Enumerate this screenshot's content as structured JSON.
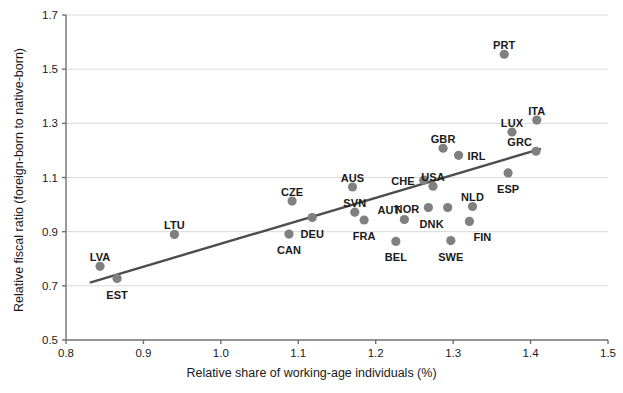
{
  "chart_data": {
    "type": "scatter",
    "title": "",
    "xlabel": "Relative share of working-age individuals (%)",
    "ylabel": "Relative fiscal ratio (foreign-born to native-born)",
    "xlim": [
      0.8,
      1.5
    ],
    "ylim": [
      0.5,
      1.7
    ],
    "xticks": [
      "0.8",
      "0.9",
      "1.0",
      "1.1",
      "1.2",
      "1.3",
      "1.4",
      "1.5"
    ],
    "xtick_values": [
      0.8,
      0.9,
      1.0,
      1.1,
      1.2,
      1.3,
      1.4,
      1.5
    ],
    "yticks": [
      "0.5",
      "0.7",
      "0.9",
      "1.1",
      "1.3",
      "1.5",
      "1.7"
    ],
    "ytick_values": [
      0.5,
      0.7,
      0.9,
      1.1,
      1.3,
      1.5,
      1.7
    ],
    "grid": "horizontal",
    "legend": "none",
    "marker_color": "#808080",
    "line_color": "#4d4d4d",
    "axis_color": "#707070",
    "grid_color": "#d9d9d9",
    "text_color": "#1a1a1a",
    "marker_size": 6,
    "trendline": {
      "x0": 0.832,
      "y0": 0.713,
      "x1": 1.412,
      "y1": 1.205
    },
    "points": [
      {
        "label": "LVA",
        "x": 0.844,
        "y": 0.772,
        "lpos": "above"
      },
      {
        "label": "EST",
        "x": 0.866,
        "y": 0.727,
        "lpos": "below"
      },
      {
        "label": "LTU",
        "x": 0.94,
        "y": 0.89,
        "lpos": "above"
      },
      {
        "label": "CZE",
        "x": 1.092,
        "y": 1.013,
        "lpos": "above"
      },
      {
        "label": "CAN",
        "x": 1.088,
        "y": 0.891,
        "lpos": "below"
      },
      {
        "label": "DEU",
        "x": 1.118,
        "y": 0.952,
        "lpos": "below"
      },
      {
        "label": "AUS",
        "x": 1.17,
        "y": 1.065,
        "lpos": "above"
      },
      {
        "label": "SVN",
        "x": 1.173,
        "y": 0.972,
        "lpos": "above"
      },
      {
        "label": "FRA",
        "x": 1.185,
        "y": 0.943,
        "lpos": "below"
      },
      {
        "label": "BEL",
        "x": 1.226,
        "y": 0.864,
        "lpos": "below"
      },
      {
        "label": "AUT",
        "x": 1.237,
        "y": 0.945,
        "lpos": "above-left"
      },
      {
        "label": "CHE",
        "x": 1.262,
        "y": 1.09,
        "lpos": "left"
      },
      {
        "label": "NOR",
        "x": 1.268,
        "y": 0.989,
        "lpos": "left"
      },
      {
        "label": "GBR",
        "x": 1.287,
        "y": 1.208,
        "lpos": "above"
      },
      {
        "label": "USA",
        "x": 1.274,
        "y": 1.068,
        "lpos": "above"
      },
      {
        "label": "DNK",
        "x": 1.293,
        "y": 0.989,
        "lpos": "below-left"
      },
      {
        "label": "SWE",
        "x": 1.297,
        "y": 0.867,
        "lpos": "below"
      },
      {
        "label": "IRL",
        "x": 1.307,
        "y": 1.182,
        "lpos": "right"
      },
      {
        "label": "NLD",
        "x": 1.325,
        "y": 0.993,
        "lpos": "above"
      },
      {
        "label": "FIN",
        "x": 1.321,
        "y": 0.938,
        "lpos": "below-right"
      },
      {
        "label": "PRT",
        "x": 1.366,
        "y": 1.555,
        "lpos": "above"
      },
      {
        "label": "ESP",
        "x": 1.371,
        "y": 1.117,
        "lpos": "below"
      },
      {
        "label": "LUX",
        "x": 1.376,
        "y": 1.268,
        "lpos": "above"
      },
      {
        "label": "ITA",
        "x": 1.408,
        "y": 1.312,
        "lpos": "above"
      },
      {
        "label": "GRC",
        "x": 1.407,
        "y": 1.197,
        "lpos": "above-left"
      }
    ]
  }
}
